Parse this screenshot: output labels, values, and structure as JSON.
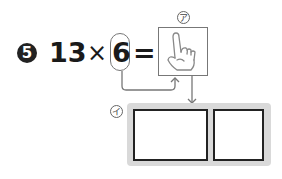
{
  "problem": {
    "number": "5",
    "multiplicand": "13",
    "operator": "×",
    "multiplier": "6",
    "equals": "="
  },
  "labels": {
    "a": "ア",
    "i": "イ"
  },
  "icons": {
    "hand": "pointing-hand-icon"
  },
  "answer_boxes": [
    {
      "value": ""
    },
    {
      "value": ""
    }
  ],
  "colors": {
    "text": "#1a1a1a",
    "line": "#777777",
    "panel": "#d9d9d9"
  }
}
